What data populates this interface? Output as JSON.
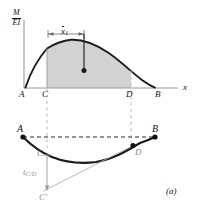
{
  "figure": {
    "caption": "(a)",
    "axis_label_numerator": "M",
    "axis_label_denominator": "EI",
    "x_axis_label": "x",
    "centroid_dimension_label": "x",
    "centroid_dimension_subscript": "1",
    "tangential_deviation_label": "t",
    "tangential_deviation_subscript": "C/D",
    "points_moment_diagram": [
      {
        "name": "A",
        "label": "A"
      },
      {
        "name": "C",
        "label": "C"
      },
      {
        "name": "D",
        "label": "D"
      },
      {
        "name": "B",
        "label": "B"
      }
    ],
    "points_elastic_curve": [
      {
        "name": "A",
        "label": "A"
      },
      {
        "name": "C",
        "label": "C"
      },
      {
        "name": "D",
        "label": "D"
      },
      {
        "name": "B",
        "label": "B"
      },
      {
        "name": "C-prime",
        "label": "C′"
      }
    ]
  },
  "chart_data": {
    "type": "area",
    "title": "",
    "subtitle": "",
    "xlabel": "x",
    "ylabel": "M/EI",
    "grid": false,
    "legend": null,
    "panels": [
      {
        "name": "moment-diagram",
        "type": "area",
        "xlabel": "x",
        "ylabel": "M/EI",
        "xlim": [
          0,
          1
        ],
        "ylim": [
          0,
          1
        ],
        "x_tick_labels": [
          "A",
          "C",
          "D",
          "B"
        ],
        "x_tick_positions": [
          0.0,
          0.21,
          0.76,
          0.93
        ],
        "curve_points": [
          [
            0.0,
            0.0
          ],
          [
            0.07,
            0.38
          ],
          [
            0.14,
            0.62
          ],
          [
            0.21,
            0.8
          ],
          [
            0.3,
            0.92
          ],
          [
            0.38,
            0.96
          ],
          [
            0.48,
            0.9
          ],
          [
            0.58,
            0.79
          ],
          [
            0.68,
            0.64
          ],
          [
            0.76,
            0.5
          ],
          [
            0.85,
            0.3
          ],
          [
            0.93,
            0.0
          ]
        ],
        "shaded_region": {
          "from_label": "C",
          "to_label": "D",
          "from_x": 0.21,
          "to_x": 0.76,
          "fill": "#d2d2d2"
        },
        "centroid_marker": {
          "x": 0.455,
          "y": 0.4
        },
        "dimension": {
          "label": "x̄1",
          "from_x": 0.21,
          "to_x": 0.455
        }
      },
      {
        "name": "elastic-curve",
        "type": "line",
        "xlim": [
          0,
          1
        ],
        "ylim": [
          0,
          1
        ],
        "chord": {
          "from_label": "A",
          "to_label": "B"
        },
        "deflection_points": [
          [
            0.0,
            1.0
          ],
          [
            0.1,
            0.73
          ],
          [
            0.21,
            0.55
          ],
          [
            0.35,
            0.42
          ],
          [
            0.5,
            0.38
          ],
          [
            0.62,
            0.42
          ],
          [
            0.76,
            0.55
          ],
          [
            0.88,
            0.78
          ],
          [
            0.96,
            1.0
          ]
        ],
        "tangent_line": {
          "from_label": "D",
          "to_label": "C′"
        },
        "deviation_arrow": {
          "from_label": "C",
          "to_label": "C′"
        }
      }
    ]
  },
  "colors": {
    "curve": "#1a1a1a",
    "shading": "#d2d2d2",
    "axis": "#9a9a9a",
    "dashed": "#b4b4b4",
    "tangent": "#a8a8a8",
    "text": "#111111",
    "text_gray": "#8a8a8a"
  }
}
